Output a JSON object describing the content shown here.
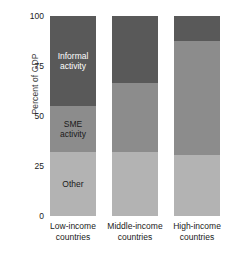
{
  "chart_data": {
    "type": "bar",
    "title": "",
    "subtitle": "",
    "xlabel": "",
    "ylabel": "Percent of GDP",
    "ylim": [
      0,
      100
    ],
    "yticks": [
      0,
      25,
      50,
      75,
      100
    ],
    "ytick_labels": [
      "0",
      "25",
      "50",
      "75",
      "100"
    ],
    "grid": false,
    "stacked": true,
    "legend": "in-bar-labels",
    "categories": [
      "Low-income\ncountries",
      "Middle-income\ncountries",
      "High-income\ncountries"
    ],
    "series": [
      {
        "name": "Other",
        "color": "#b3b3b3",
        "label_color": "#1a1a1a",
        "values": [
          32,
          32,
          30.5
        ]
      },
      {
        "name": "SME\nactivity",
        "color": "#8c8c8c",
        "label_color": "#1a1a1a",
        "values": [
          23,
          34.5,
          57
        ]
      },
      {
        "name": "Informal\nactivity",
        "color": "#595959",
        "label_color": "#ffffff",
        "values": [
          45,
          33.5,
          12.5
        ]
      }
    ],
    "segment_tops": {
      "other": [
        32,
        32,
        30.5
      ],
      "sme": [
        55,
        66.5,
        87.5
      ],
      "informal": [
        100,
        100,
        100
      ]
    },
    "in_bar_labels": [
      {
        "bar": 0,
        "series": "Informal\nactivity",
        "text": "Informal\nactivity"
      },
      {
        "bar": 0,
        "series": "SME\nactivity",
        "text": "SME\nactivity"
      },
      {
        "bar": 0,
        "series": "Other",
        "text": "Other"
      }
    ],
    "colors": {
      "informal": "#595959",
      "sme": "#8c8c8c",
      "other": "#b3b3b3",
      "background": "#ffffff",
      "text": "#1a1a1a",
      "axis_text": "#3b3b3b"
    }
  }
}
